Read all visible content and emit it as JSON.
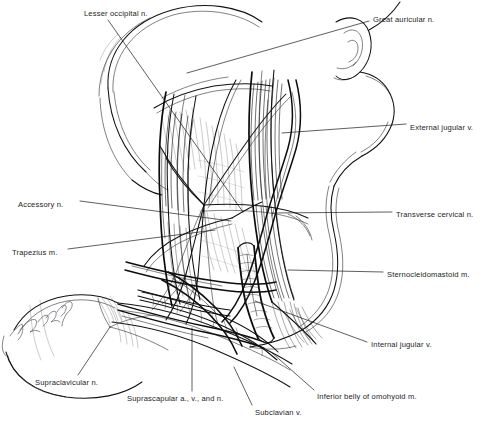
{
  "figure": {
    "background_color": "#ffffff",
    "ink_color": "#111111",
    "artist_signature": "Jandel"
  },
  "labels": [
    {
      "id": "lesser-occipital-n",
      "text": "Lesser occipital n.",
      "x": 84,
      "y": 13,
      "anchor": "start"
    },
    {
      "id": "great-auricular-n",
      "text": "Great auricular n.",
      "x": 373,
      "y": 19,
      "anchor": "start"
    },
    {
      "id": "external-jugular-v",
      "text": "External jugular v.",
      "x": 410,
      "y": 127,
      "anchor": "start"
    },
    {
      "id": "accessory-n",
      "text": "Accessory n.",
      "x": 18,
      "y": 204,
      "anchor": "start"
    },
    {
      "id": "transverse-cervical-n",
      "text": "Transverse cervical n.",
      "x": 396,
      "y": 214,
      "anchor": "start"
    },
    {
      "id": "trapezius-m",
      "text": "Trapezius m.",
      "x": 12,
      "y": 252,
      "anchor": "start"
    },
    {
      "id": "sternocleidomastoid-m",
      "text": "Sternocleidomastoid m.",
      "x": 387,
      "y": 274,
      "anchor": "start"
    },
    {
      "id": "internal-jugular-v",
      "text": "Internal jugular v.",
      "x": 371,
      "y": 344,
      "anchor": "start"
    },
    {
      "id": "supraclavicular-n",
      "text": "Supraclavicular n.",
      "x": 35,
      "y": 382,
      "anchor": "start"
    },
    {
      "id": "suprascapular-a-v-n",
      "text": "Suprascapular a., v., and n.",
      "x": 127,
      "y": 398,
      "anchor": "start"
    },
    {
      "id": "inferior-belly-omohyoid-m",
      "text": "Inferior belly of omohyoid m.",
      "x": 317,
      "y": 396,
      "anchor": "start"
    },
    {
      "id": "subclavian-v",
      "text": "Subclavian v.",
      "x": 255,
      "y": 412,
      "anchor": "start"
    }
  ],
  "leader_lines": [
    {
      "id": "leader-lesser-occipital-n",
      "points": "108,20 243,212"
    },
    {
      "id": "leader-great-auricular-n",
      "points": "369,21 187,73"
    },
    {
      "id": "leader-external-jugular-v",
      "points": "406,124 282,133"
    },
    {
      "id": "leader-accessory-n",
      "points": "80,201 231,221"
    },
    {
      "id": "leader-transverse-cervical-n",
      "points": "392,212 272,213"
    },
    {
      "id": "leader-trapezius-m",
      "points": "68,249 215,230"
    },
    {
      "id": "leader-sternocleidomastoid-m",
      "points": "383,272 288,270"
    },
    {
      "id": "leader-internal-jugular-v",
      "points": "367,342 255,301"
    },
    {
      "id": "leader-supraclavicular-n",
      "points": "78,375 110,327"
    },
    {
      "id": "leader-suprascapular-a-v-n",
      "points": "192,391 192,328"
    },
    {
      "id": "leader-inferior-belly-omohyoid-m",
      "points": "314,390 271,352"
    },
    {
      "id": "leader-subclavian-v",
      "points": "252,405 234,367"
    }
  ],
  "structures": [
    {
      "id": "head-scalp",
      "name": "Head and scalp outline"
    },
    {
      "id": "ear-auricle",
      "name": "Ear (auricle)"
    },
    {
      "id": "jaw-profile",
      "name": "Mandible and face profile"
    },
    {
      "id": "sternocleidomastoid",
      "name": "Sternocleidomastoid muscle belly"
    },
    {
      "id": "trapezius",
      "name": "Trapezius muscle belly"
    },
    {
      "id": "posterior-triangle",
      "name": "Posterior cervical triangle fascia"
    },
    {
      "id": "clavicle",
      "name": "Clavicle and shoulder contour"
    },
    {
      "id": "deltoid",
      "name": "Deltoid / upper arm"
    },
    {
      "id": "external-jugular-vein",
      "name": "External jugular vein"
    },
    {
      "id": "internal-jugular-vein",
      "name": "Internal jugular vein"
    },
    {
      "id": "subclavian-vein",
      "name": "Subclavian vein"
    },
    {
      "id": "omohyoid",
      "name": "Inferior belly of omohyoid muscle"
    },
    {
      "id": "cutaneous-nerve-plexus",
      "name": "Cervical plexus cutaneous nerves"
    },
    {
      "id": "accessory-nerve",
      "name": "Spinal accessory nerve"
    }
  ]
}
